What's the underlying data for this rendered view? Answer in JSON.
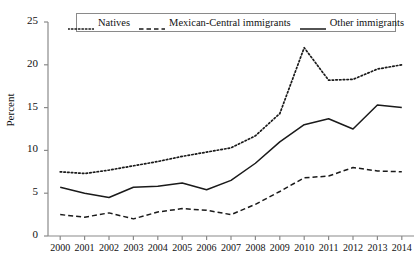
{
  "chart_data": {
    "type": "line",
    "title": "",
    "xlabel": "",
    "ylabel": "Percent",
    "ylim": [
      0,
      25
    ],
    "yticks": [
      0,
      5,
      10,
      15,
      20,
      25
    ],
    "grid": false,
    "legend_position": "top-center",
    "x": [
      2000,
      2001,
      2002,
      2003,
      2004,
      2005,
      2006,
      2007,
      2008,
      2009,
      2010,
      2011,
      2012,
      2013,
      2014
    ],
    "categories": [
      "2000",
      "2001",
      "2002",
      "2003",
      "2004",
      "2005",
      "2006",
      "2007",
      "2008",
      "2009",
      "2010",
      "2011",
      "2012",
      "2013",
      "2014"
    ],
    "series": [
      {
        "name": "Natives",
        "style": "dotted",
        "color": "#1a1a1a",
        "values": [
          7.5,
          7.3,
          7.7,
          8.2,
          8.7,
          9.3,
          9.8,
          10.3,
          11.7,
          14.3,
          22.0,
          18.2,
          18.3,
          19.5,
          20.0
        ]
      },
      {
        "name": "Mexican-Central immigrants",
        "style": "dashed",
        "color": "#1a1a1a",
        "values": [
          2.5,
          2.2,
          2.7,
          2.0,
          2.8,
          3.2,
          3.0,
          2.5,
          3.7,
          5.2,
          6.8,
          7.0,
          8.0,
          7.6,
          7.5
        ]
      },
      {
        "name": "Other immigrants",
        "style": "solid",
        "color": "#1a1a1a",
        "values": [
          5.7,
          5.0,
          4.5,
          5.7,
          5.8,
          6.2,
          5.4,
          6.5,
          8.5,
          11.0,
          13.0,
          13.7,
          12.5,
          15.3,
          15.0
        ]
      }
    ]
  },
  "legend": {
    "items": [
      {
        "label": "Natives",
        "style": "dotted"
      },
      {
        "label": "Mexican-Central immigrants",
        "style": "dashed"
      },
      {
        "label": "Other immigrants",
        "style": "solid"
      }
    ]
  },
  "axes": {
    "y_title": "Percent",
    "y_tick_labels": [
      "25",
      "20",
      "15",
      "10",
      "5",
      "0"
    ],
    "x_tick_labels": [
      "2000",
      "2001",
      "2002",
      "2003",
      "2004",
      "2005",
      "2006",
      "2007",
      "2008",
      "2009",
      "2010",
      "2011",
      "2012",
      "2013",
      "2014"
    ]
  },
  "colors": {
    "axis": "#8a8a8a",
    "series": "#1a1a1a",
    "legend_border": "#8a8a8a",
    "background": "#ffffff"
  }
}
